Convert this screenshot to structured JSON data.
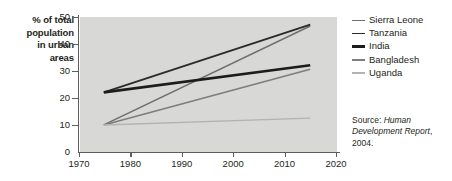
{
  "chart_data": {
    "type": "line",
    "title": "",
    "xlabel": "",
    "ylabel": "% of total population in urban areas",
    "xlim": [
      1970,
      2020
    ],
    "ylim": [
      0,
      50
    ],
    "xticks": [
      "1970",
      "1980",
      "1990",
      "2000",
      "2010",
      "2020"
    ],
    "yticks": [
      "0",
      "10",
      "20",
      "30",
      "40",
      "50"
    ],
    "grid": false,
    "legend_position": "right",
    "x": [
      1975,
      2015
    ],
    "series": [
      {
        "name": "Sierra Leone",
        "values": [
          10,
          46.5
        ],
        "color": "#6f6f6f",
        "width": 1.5
      },
      {
        "name": "Tanzania",
        "values": [
          22,
          47
        ],
        "color": "#2b2b2b",
        "width": 1.9
      },
      {
        "name": "India",
        "values": [
          22,
          32
        ],
        "color": "#1c1c1c",
        "width": 2.6
      },
      {
        "name": "Bangladesh",
        "values": [
          10,
          30.5
        ],
        "color": "#7d7d7d",
        "width": 1.6
      },
      {
        "name": "Uganda",
        "values": [
          10,
          12.5
        ],
        "color": "#b3b3b3",
        "width": 1.5
      }
    ]
  },
  "axis": {
    "y_title_lines": [
      "% of total",
      "population",
      "in urban",
      "areas"
    ],
    "y_tick_labels": [
      "50",
      "40",
      "30",
      "20",
      "10",
      "0"
    ],
    "x_tick_labels": [
      "1970",
      "1980",
      "1990",
      "2000",
      "2010",
      "2020"
    ]
  },
  "source": {
    "prefix": "Source: ",
    "title": "Human Development Report",
    "suffix": ", 2004."
  },
  "colors": {
    "plot_background": "#d8d8d6",
    "axis": "#5d5d5d",
    "text": "#231f20",
    "page_background": "#ffffff"
  }
}
